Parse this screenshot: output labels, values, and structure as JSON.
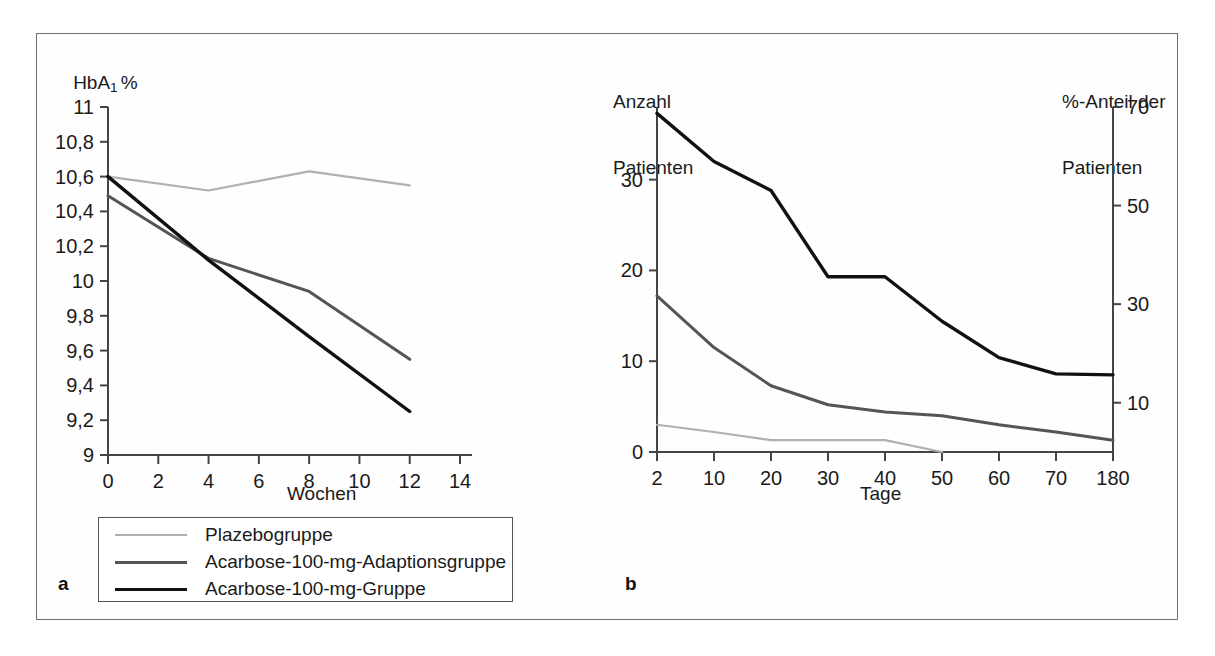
{
  "figure": {
    "panel_a_label": "a",
    "panel_b_label": "b"
  },
  "legend": {
    "items": [
      {
        "label": "Plazebogruppe",
        "color": "#b0b0b0",
        "width": 2
      },
      {
        "label": "Acarbose-100-mg-Adaptionsgruppe",
        "color": "#555555",
        "width": 3
      },
      {
        "label": "Acarbose-100-mg-Gruppe",
        "color": "#111111",
        "width": 3.5
      }
    ]
  },
  "chart_data": [
    {
      "id": "panel_a",
      "type": "line",
      "title": "",
      "ylabel": "HbA₁ %",
      "ylabel_main": "HbA",
      "ylabel_sub": "1",
      "ylabel_unit": "%",
      "xlabel": "Wochen",
      "xlim": [
        0,
        14
      ],
      "ylim": [
        9,
        11
      ],
      "grid": false,
      "xticks": [
        0,
        2,
        4,
        6,
        8,
        10,
        12,
        14
      ],
      "xtick_labels": [
        "0",
        "2",
        "4",
        "6",
        "8",
        "10",
        "12",
        "14"
      ],
      "yticks": [
        9,
        9.2,
        9.4,
        9.6,
        9.8,
        10,
        10.2,
        10.4,
        10.6,
        10.8,
        11
      ],
      "ytick_labels": [
        "9",
        "9,2",
        "9,4",
        "9,6",
        "9,8",
        "10",
        "10,2",
        "10,4",
        "10,6",
        "10,8",
        "11"
      ],
      "x": [
        0,
        4,
        8,
        12
      ],
      "series": [
        {
          "name": "Plazebogruppe",
          "color": "#b0b0b0",
          "width": 2.2,
          "values": [
            10.6,
            10.52,
            10.63,
            10.55
          ]
        },
        {
          "name": "Acarbose-100-mg-Adaptionsgruppe",
          "color": "#555555",
          "width": 3,
          "values": [
            10.49,
            10.13,
            9.94,
            9.55
          ]
        },
        {
          "name": "Acarbose-100-mg-Gruppe",
          "color": "#111111",
          "width": 3.4,
          "values": [
            10.6,
            10.12,
            9.68,
            9.25
          ]
        }
      ]
    },
    {
      "id": "panel_b",
      "type": "line",
      "title": "",
      "ylabel_left_line1": "Anzahl",
      "ylabel_left_line2": "Patienten",
      "ylabel_right_line1": "%-Anteil der",
      "ylabel_right_line2": "Patienten",
      "xlabel": "Tage",
      "ylim_left": [
        0,
        38
      ],
      "ylim_right": [
        0,
        70
      ],
      "grid": false,
      "xtick_labels": [
        "2",
        "10",
        "20",
        "30",
        "40",
        "50",
        "60",
        "70",
        "180"
      ],
      "yticks_left": [
        0,
        10,
        20,
        30
      ],
      "ytick_labels_left": [
        "0",
        "10",
        "20",
        "30"
      ],
      "yticks_right": [
        10,
        30,
        50,
        70
      ],
      "ytick_labels_right": [
        "10",
        "30",
        "50",
        "70"
      ],
      "x_categories": [
        2,
        10,
        20,
        30,
        40,
        50,
        60,
        70,
        180
      ],
      "series": [
        {
          "name": "Plazebogruppe",
          "color": "#b0b0b0",
          "width": 2.2,
          "values": [
            3.0,
            2.2,
            1.3,
            1.3,
            1.3,
            0.0,
            null,
            null,
            null
          ]
        },
        {
          "name": "Acarbose-100-mg-Adaptionsgruppe",
          "color": "#555555",
          "width": 3,
          "values": [
            17.2,
            11.5,
            7.3,
            5.2,
            4.4,
            4.0,
            3.0,
            2.2,
            1.3
          ]
        },
        {
          "name": "Acarbose-100-mg-Gruppe",
          "color": "#111111",
          "width": 3.4,
          "values": [
            37.3,
            32.0,
            28.8,
            19.3,
            19.3,
            14.4,
            10.4,
            8.6,
            8.5
          ]
        }
      ]
    }
  ]
}
